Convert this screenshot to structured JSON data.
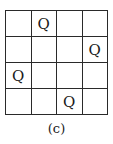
{
  "board": {
    "size": 4,
    "queen_symbol": "Q",
    "rows": [
      [
        "",
        "Q",
        "",
        ""
      ],
      [
        "",
        "",
        "",
        "Q"
      ],
      [
        "Q",
        "",
        "",
        ""
      ],
      [
        "",
        "",
        "Q",
        ""
      ]
    ]
  },
  "caption": "(c)"
}
